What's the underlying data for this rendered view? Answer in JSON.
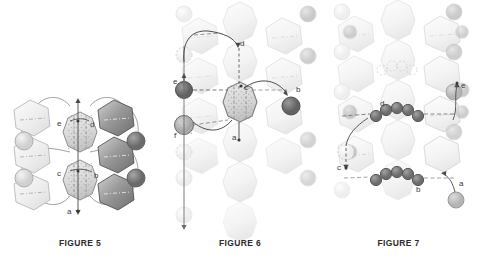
{
  "page": {
    "type": "patent-figure-sheet",
    "background": "#ffffff",
    "width": 477,
    "height": 262
  },
  "colors": {
    "ink": "#3a3a3a",
    "lattice_light": "#e8e8e8",
    "lattice_mid": "#cfcfcf",
    "lattice_dark": "#8e8e8e",
    "site_dark": "#6f6f6f",
    "site_mid": "#a8a8a8",
    "site_light": "#d8d8d8",
    "path_line": "#4a4a4a",
    "dashed": "#5a5a5a",
    "ghost": "#f1f1f1"
  },
  "figures": [
    {
      "id": "figure-5",
      "caption": "FIGURE 5",
      "path_labels": [
        "e",
        "d",
        "c",
        "b",
        "a"
      ],
      "labels": [
        {
          "text": "e",
          "x": 61,
          "y": 123
        },
        {
          "text": "d",
          "x": 92,
          "y": 124
        },
        {
          "text": "c",
          "x": 61,
          "y": 173
        },
        {
          "text": "b",
          "x": 95,
          "y": 175
        },
        {
          "text": "a",
          "x": 70,
          "y": 213
        }
      ],
      "notes": "Central column of shaded octagonal cages with vertical arrow axis; light hexagons at left, dark shaded hexagons at right; circular sites on outer ring"
    },
    {
      "id": "figure-6",
      "caption": "FIGURE 6",
      "path_labels": [
        "d",
        "e",
        "c",
        "b",
        "f",
        "a"
      ],
      "labels": [
        {
          "text": "d",
          "x": 240,
          "y": 45
        },
        {
          "text": "e",
          "x": 182,
          "y": 82
        },
        {
          "text": "c",
          "x": 242,
          "y": 96
        },
        {
          "text": "b",
          "x": 296,
          "y": 95
        },
        {
          "text": "f",
          "x": 181,
          "y": 124
        },
        {
          "text": "a",
          "x": 236,
          "y": 142
        }
      ],
      "notes": "Faded lattice background with a single highlighted octagonal cage at centre; dark filled circular sites on a vertical left column and at right end of pathway b"
    },
    {
      "id": "figure-7",
      "caption": "FIGURE 7",
      "path_labels": [
        "e",
        "d",
        "c",
        "b",
        "a"
      ],
      "labels": [
        {
          "text": "e",
          "x": 452,
          "y": 103
        },
        {
          "text": "d",
          "x": 383,
          "y": 122
        },
        {
          "text": "c",
          "x": 345,
          "y": 174
        },
        {
          "text": "b",
          "x": 418,
          "y": 191
        },
        {
          "text": "a",
          "x": 457,
          "y": 193
        }
      ],
      "notes": "Very faded lattice with two horizontal arched chains of five dark circles (diffusing species) bridging adjacent cages; dashed horizontal channel axes"
    }
  ]
}
